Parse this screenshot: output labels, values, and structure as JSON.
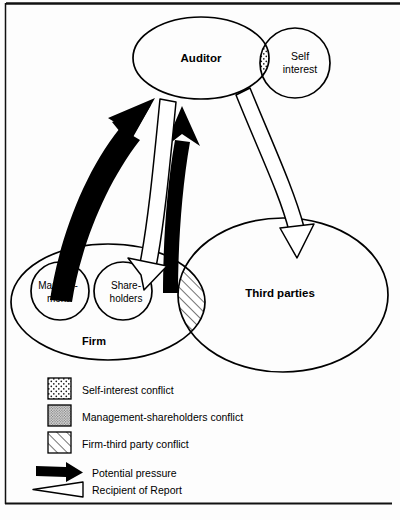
{
  "figure": {
    "background": "#fdfdfd",
    "stroke": "#000000",
    "frame": {
      "top_rule": true,
      "left_rule": true,
      "bottom_rule": true
    }
  },
  "nodes": {
    "auditor": {
      "label": "Auditor",
      "bold": true,
      "cx": 201,
      "cy": 58,
      "rx": 68,
      "ry": 41
    },
    "self_interest": {
      "label_line1": "Self",
      "label_line2": "interest",
      "bold": false,
      "cx": 295,
      "cy": 63,
      "r": 35
    },
    "firm": {
      "label": "Firm",
      "bold": true,
      "cx": 108,
      "cy": 302,
      "rx": 97,
      "ry": 58
    },
    "management": {
      "label_line1": "Manage-",
      "label_line2": "ment",
      "bold": false,
      "cx": 60,
      "cy": 291,
      "r": 29
    },
    "shareholders": {
      "label_line1": "Share-",
      "label_line2": "holders",
      "bold": false,
      "cx": 123,
      "cy": 291,
      "r": 29
    },
    "third_parties": {
      "label": "Third parties",
      "bold": true,
      "cx": 283,
      "cy": 295,
      "rx": 105,
      "ry": 77
    }
  },
  "overlaps": [
    {
      "name": "self-interest-conflict-lens",
      "pattern": "sparse-dots"
    },
    {
      "name": "management-shareholders-conflict-lens",
      "pattern": "dense-dots"
    },
    {
      "name": "firm-third-party-conflict-lens",
      "pattern": "diagonal-hatch"
    }
  ],
  "arrows": [
    {
      "name": "management-to-auditor-pressure",
      "style": "solid-black",
      "from": "Management",
      "to": "Auditor"
    },
    {
      "name": "shareholders-to-auditor-pressure",
      "style": "solid-black",
      "from": "Shareholders",
      "to": "Auditor"
    },
    {
      "name": "auditor-to-shareholders-report",
      "style": "hollow-white",
      "from": "Auditor",
      "to": "Shareholders"
    },
    {
      "name": "auditor-to-third-parties-report",
      "style": "hollow-white",
      "from": "Auditor",
      "to": "Third parties"
    }
  ],
  "legend": {
    "items": [
      {
        "swatch": "sparse-dots",
        "label": "Self-interest conflict"
      },
      {
        "swatch": "dense-dots",
        "label": "Management-shareholders conflict"
      },
      {
        "swatch": "diagonal-hatch",
        "label": "Firm-third party conflict"
      },
      {
        "swatch": "solid-black-arrow",
        "label": "Potential pressure"
      },
      {
        "swatch": "hollow-white-arrow",
        "label": "Recipient of Report"
      }
    ]
  }
}
